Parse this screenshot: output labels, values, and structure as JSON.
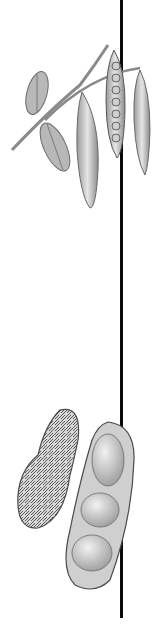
{
  "illustration": {
    "subject": "Botanical comparison: pea plant with pods and peanut shells",
    "background": "#ffffff",
    "line_color": "#0a0a0a",
    "top": {
      "name": "pea branch",
      "elements": [
        "stem",
        "leaf",
        "leaf",
        "pod",
        "open pod with peas",
        "pod"
      ],
      "pea_count_visible": 7
    },
    "bottom": {
      "name": "peanuts",
      "elements": [
        "whole peanut shell",
        "opened peanut shell"
      ],
      "kernel_count_visible": 3
    }
  }
}
